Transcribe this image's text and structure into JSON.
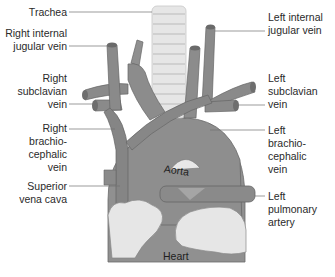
{
  "diagram": {
    "colors": {
      "vessel": "#8a8a8a",
      "vessel_dark": "#6e6e6e",
      "vessel_light": "#a8a8a8",
      "heart": "#909090",
      "trachea": "#e4e4e4",
      "fat": "#e2e2e2",
      "leader_line": "#707070",
      "text": "#2a2a2a"
    },
    "labels_left": [
      {
        "id": "trachea",
        "lines": [
          "Trachea"
        ]
      },
      {
        "id": "right-internal-jugular-vein",
        "lines": [
          "Right internal",
          "jugular vein"
        ]
      },
      {
        "id": "right-subclavian-vein",
        "lines": [
          "Right",
          "subclavian",
          "vein"
        ]
      },
      {
        "id": "right-brachiocephalic-vein",
        "lines": [
          "Right",
          "brachio-",
          "cephalic",
          "vein"
        ]
      },
      {
        "id": "superior-vena-cava",
        "lines": [
          "Superior",
          "vena cava"
        ]
      }
    ],
    "labels_right": [
      {
        "id": "left-internal-jugular-vein",
        "lines": [
          "Left internal",
          "jugular vein"
        ]
      },
      {
        "id": "left-subclavian-vein",
        "lines": [
          "Left",
          "subclavian",
          "vein"
        ]
      },
      {
        "id": "left-brachiocephalic-vein",
        "lines": [
          "Left",
          "brachio-",
          "cephalic",
          "vein"
        ]
      },
      {
        "id": "left-pulmonary-artery",
        "lines": [
          "Left",
          "pulmonary",
          "artery"
        ]
      }
    ],
    "inline_labels": {
      "aorta": "Aorta",
      "heart": "Heart"
    }
  }
}
